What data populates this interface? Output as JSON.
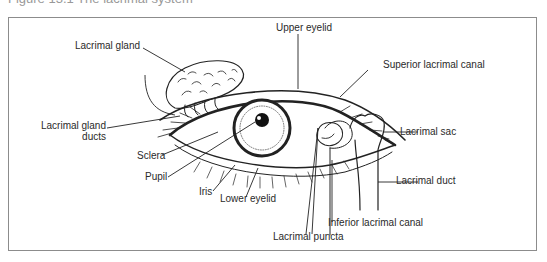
{
  "caption": "Figure 13.1   The lacrimal system",
  "diagram": {
    "labels": {
      "lacrimal_gland": "Lacrimal gland",
      "lacrimal_gland_ducts_line1": "Lacrimal gland",
      "lacrimal_gland_ducts_line2": "ducts",
      "upper_eyelid": "Upper eyelid",
      "superior_lacrimal_canal": "Superior lacrimal canal",
      "lacrimal_sac": "Lacrimal sac",
      "lacrimal_duct": "Lacrimal duct",
      "inferior_lacrimal_canal": "Inferior lacrimal canal",
      "lacrimal_puncta": "Lacrimal puncta",
      "sclera": "Sclera",
      "pupil": "Pupil",
      "iris": "Iris",
      "lower_eyelid": "Lower eyelid"
    },
    "colors": {
      "line": "#222222",
      "frame": "#8c8c8c",
      "background": "#ffffff"
    }
  }
}
